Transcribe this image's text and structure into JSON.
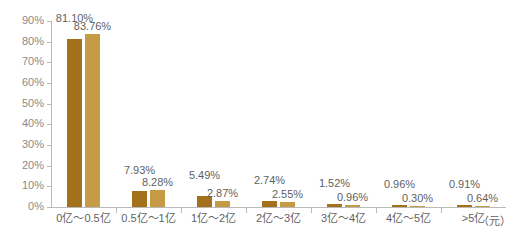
{
  "chart_data": {
    "type": "bar",
    "title": "",
    "subtitle": "",
    "xlabel": "（元）",
    "ylabel": "",
    "ylim": [
      0,
      90
    ],
    "grid": false,
    "legend": "none",
    "categories": [
      "0亿～0.5亿",
      "0.5亿～1亿",
      "1亿～2亿",
      "2亿～3亿",
      "3亿～4亿",
      "4亿～5亿",
      ">5亿"
    ],
    "ytick_labels": [
      "0%",
      "10%",
      "20%",
      "30%",
      "40%",
      "50%",
      "60%",
      "70%",
      "80%",
      "90%"
    ],
    "ytick_values": [
      0,
      10,
      20,
      30,
      40,
      50,
      60,
      70,
      80,
      90
    ],
    "series": [
      {
        "name": "series-1",
        "color": "#a3701b",
        "values": [
          81.1,
          7.93,
          5.49,
          2.74,
          1.52,
          0.96,
          0.91
        ],
        "labels": [
          "81.10%",
          "7.93%",
          "5.49%",
          "2.74%",
          "1.52%",
          "0.96%",
          "0.91%"
        ]
      },
      {
        "name": "series-2",
        "color": "#c69b46",
        "values": [
          83.76,
          8.28,
          2.87,
          2.55,
          0.96,
          0.3,
          0.64
        ],
        "labels": [
          "83.76%",
          "8.28%",
          "2.87%",
          "2.55%",
          "0.96%",
          "0.30%",
          "0.64%"
        ]
      }
    ]
  },
  "colors": {
    "series_dark": "#a3701b",
    "series_light": "#c69b46",
    "axis": "#b9b9b9",
    "tick_text": "#8a8a8a",
    "label_text": "#5f5f5f",
    "background": "#ffffff"
  }
}
